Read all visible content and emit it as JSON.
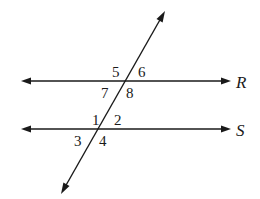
{
  "diagram": {
    "lines": [
      {
        "name": "R",
        "label": "R",
        "angles": [
          "5",
          "6",
          "7",
          "8"
        ]
      },
      {
        "name": "S",
        "label": "S",
        "angles": [
          "1",
          "2",
          "3",
          "4"
        ]
      }
    ],
    "transversal": {
      "label": ""
    },
    "angle_labels": {
      "a1": "1",
      "a2": "2",
      "a3": "3",
      "a4": "4",
      "a5": "5",
      "a6": "6",
      "a7": "7",
      "a8": "8"
    },
    "colors": {
      "ink": "#1a1a1a",
      "background": "#ffffff"
    }
  }
}
